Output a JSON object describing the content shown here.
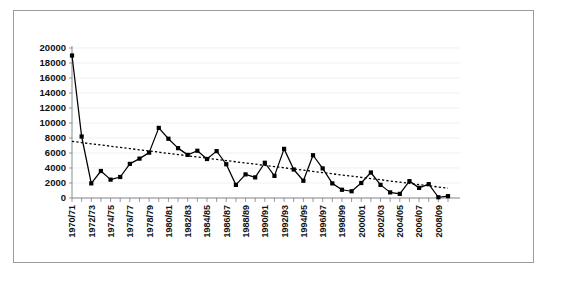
{
  "figure": {
    "top_cutoff_text": "",
    "frame_color": "#9a9aa0",
    "background_color": "#ffffff"
  },
  "chart_data": {
    "type": "line",
    "title": "",
    "subtitle": "",
    "xlabel": "",
    "ylabel": "",
    "grid": true,
    "legend": "none",
    "ylim": [
      0,
      20000
    ],
    "ytick_step": 2000,
    "ytick_labels": [
      "0",
      "2000",
      "4000",
      "6000",
      "8000",
      "10000",
      "12000",
      "14000",
      "16000",
      "18000",
      "20000"
    ],
    "ytick_values": [
      0,
      2000,
      4000,
      6000,
      8000,
      10000,
      12000,
      14000,
      16000,
      18000,
      20000
    ],
    "categories": [
      "1970/71",
      "1971/72",
      "1972/73",
      "1973/74",
      "1974/75",
      "1975/76",
      "1976/77",
      "1977/78",
      "1978/79",
      "1979/80",
      "1980/81",
      "1981/82",
      "1982/83",
      "1983/84",
      "1984/85",
      "1985/86",
      "1986/87",
      "1987/88",
      "1988/89",
      "1989/90",
      "1990/91",
      "1991/92",
      "1992/93",
      "1993/94",
      "1994/95",
      "1995/96",
      "1996/97",
      "1997/98",
      "1998/99",
      "1999/00",
      "2000/01",
      "2001/02",
      "2002/03",
      "2003/04",
      "2004/05",
      "2005/06",
      "2006/07",
      "2007/08",
      "2008/09",
      "2009/10"
    ],
    "xtick_labels_shown": [
      "1970/71",
      "1972/73",
      "1974/75",
      "1976/77",
      "1978/79",
      "1980/81",
      "1982/83",
      "1984/85",
      "1986/87",
      "1988/89",
      "1990/91",
      "1992/93",
      "1994/95",
      "1996/97",
      "1998/99",
      "2000/01",
      "2002/03",
      "2004/05",
      "2006/07",
      "2008/09"
    ],
    "xtick_label_interval": 2,
    "xtick_label_rotation": -90,
    "series": [
      {
        "name": "values",
        "style": "solid-line-with-square-markers",
        "color": "#000000",
        "values": [
          19000,
          8200,
          1950,
          3600,
          2450,
          2800,
          4550,
          5250,
          6050,
          9350,
          7900,
          6650,
          5750,
          6300,
          5200,
          6250,
          4500,
          1750,
          3150,
          2750,
          4700,
          2950,
          6550,
          3800,
          2300,
          5700,
          3950,
          1950,
          1100,
          900,
          2000,
          3400,
          1750,
          750,
          550,
          2250,
          1350,
          1850,
          100,
          250
        ]
      },
      {
        "name": "trendline",
        "style": "dotted-linear-trend",
        "color": "#000000",
        "values": [
          7550,
          7390,
          7230,
          7070,
          6910,
          6750,
          6590,
          6430,
          6270,
          6110,
          5950,
          5790,
          5630,
          5470,
          5310,
          5150,
          4990,
          4830,
          4670,
          4510,
          4350,
          4190,
          4030,
          3870,
          3710,
          3550,
          3390,
          3230,
          3070,
          2910,
          2750,
          2590,
          2430,
          2270,
          2110,
          1950,
          1790,
          1630,
          1470,
          1310
        ]
      }
    ]
  }
}
